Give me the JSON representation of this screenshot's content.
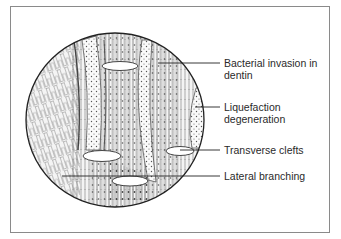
{
  "diagram": {
    "title": "",
    "colors": {
      "frame": "#8a8a8a",
      "ink": "#333333",
      "leader": "#222222",
      "background": "#ffffff"
    },
    "labels": [
      {
        "id": "bacterial-invasion",
        "line1": "Bacterial invasion in",
        "line2": "dentin"
      },
      {
        "id": "liquefaction",
        "line1": "Liquefaction",
        "line2": "degeneration"
      },
      {
        "id": "transverse-clefts",
        "line1": "Transverse clefts",
        "line2": ""
      },
      {
        "id": "lateral-branching",
        "line1": "Lateral branching",
        "line2": ""
      }
    ]
  }
}
